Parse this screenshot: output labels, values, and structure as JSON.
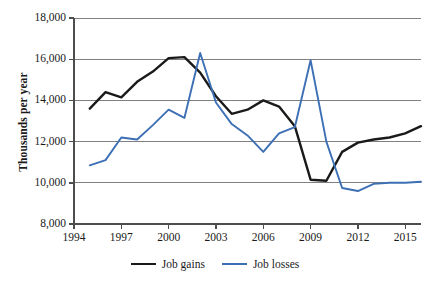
{
  "chart_data": {
    "type": "line",
    "title": "",
    "xlabel": "",
    "ylabel": "Thousands per year",
    "xlim": [
      1994,
      2016
    ],
    "ylim": [
      8000,
      18000
    ],
    "grid": true,
    "legend_position": "bottom",
    "yticks": [
      "18,000",
      "16,000",
      "14,000",
      "12,000",
      "10,000",
      "8,000"
    ],
    "ytick_values": [
      18000,
      16000,
      14000,
      12000,
      10000,
      8000
    ],
    "xticks": [
      "1994",
      "1997",
      "2000",
      "2003",
      "2006",
      "2009",
      "2012",
      "2015"
    ],
    "xtick_values": [
      1994,
      1997,
      2000,
      2003,
      2006,
      2009,
      2012,
      2015
    ],
    "x": [
      1995,
      1996,
      1997,
      1998,
      1999,
      2000,
      2001,
      2002,
      2003,
      2004,
      2005,
      2006,
      2007,
      2008,
      2009,
      2010,
      2011,
      2012,
      2013,
      2014,
      2015,
      2016
    ],
    "series": [
      {
        "name": "Job gains",
        "color": "#1a1a1a",
        "values": [
          13600,
          14400,
          14150,
          14900,
          15400,
          16050,
          16100,
          15350,
          14200,
          13350,
          13550,
          14000,
          13700,
          12750,
          10150,
          10100,
          11500,
          11950,
          12100,
          12200,
          12400,
          12750
        ]
      },
      {
        "name": "Job losses",
        "color": "#3d6fb5",
        "values": [
          10850,
          11100,
          12200,
          12100,
          12800,
          13550,
          13150,
          16300,
          13900,
          12850,
          12300,
          11500,
          12400,
          12700,
          15950,
          12000,
          9750,
          9600,
          9950,
          10000,
          10000,
          10050
        ]
      }
    ]
  },
  "legend": {
    "entries": [
      {
        "label": "Job gains"
      },
      {
        "label": "Job losses"
      }
    ]
  },
  "colors": {
    "gains": "#1a1a1a",
    "losses": "#3d6fb5",
    "gridline": "#808080",
    "axis": "#4d4d4d"
  }
}
